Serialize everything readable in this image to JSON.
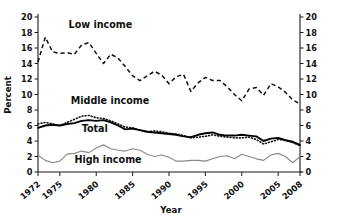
{
  "chart_data": {
    "type": "line",
    "title": "",
    "xlabel": "Year",
    "ylabel": "Percent",
    "xlim": [
      1972,
      2008
    ],
    "ylim": [
      0,
      20
    ],
    "grid": false,
    "legend": "inline-labels",
    "y_ticks": [
      0,
      2,
      4,
      6,
      8,
      10,
      12,
      14,
      16,
      18,
      20
    ],
    "y_ticks_right": [
      0,
      2,
      4,
      6,
      8,
      10,
      12,
      14,
      16,
      18,
      20
    ],
    "x_ticks": [
      1972,
      1975,
      1980,
      1985,
      1990,
      1995,
      2000,
      2005,
      2008
    ],
    "x": [
      1972,
      1973,
      1974,
      1975,
      1976,
      1977,
      1978,
      1979,
      1980,
      1981,
      1982,
      1983,
      1984,
      1985,
      1986,
      1987,
      1988,
      1989,
      1990,
      1991,
      1992,
      1993,
      1994,
      1995,
      1996,
      1997,
      1998,
      1999,
      2000,
      2001,
      2002,
      2003,
      2004,
      2005,
      2006,
      2007,
      2008
    ],
    "series": [
      {
        "name": "Low income",
        "style": "dashed",
        "color": "#111111",
        "label_x": 1976.2,
        "label_y": 18.6,
        "values": [
          14.2,
          17.4,
          15.5,
          15.3,
          15.4,
          15.2,
          16.4,
          16.7,
          15.3,
          14.0,
          15.2,
          14.7,
          13.6,
          12.4,
          11.8,
          12.4,
          13.0,
          12.5,
          11.4,
          12.3,
          12.6,
          10.4,
          11.5,
          12.2,
          11.8,
          11.8,
          11.0,
          10.0,
          9.2,
          10.7,
          10.9,
          9.9,
          11.4,
          11.0,
          10.3,
          9.3,
          8.8
        ]
      },
      {
        "name": "Middle income",
        "style": "dotted",
        "color": "#111111",
        "label_x": 1976.5,
        "label_y": 8.8,
        "values": [
          6.2,
          6.4,
          6.2,
          6.0,
          6.4,
          6.8,
          7.2,
          7.3,
          7.0,
          6.9,
          6.6,
          6.2,
          5.8,
          5.7,
          5.4,
          5.2,
          5.3,
          5.2,
          5.0,
          4.9,
          4.7,
          4.4,
          4.5,
          4.6,
          4.8,
          4.6,
          4.5,
          4.4,
          4.4,
          4.5,
          4.2,
          3.6,
          3.9,
          4.2,
          4.1,
          3.8,
          3.4
        ]
      },
      {
        "name": "Total",
        "style": "solid",
        "color": "#000000",
        "label_x": 1978.0,
        "label_y": 5.1,
        "values": [
          5.7,
          6.0,
          6.1,
          6.0,
          6.2,
          6.3,
          6.6,
          6.7,
          6.6,
          6.7,
          6.4,
          6.0,
          5.5,
          5.6,
          5.4,
          5.2,
          5.1,
          5.0,
          4.9,
          4.8,
          4.6,
          4.5,
          4.8,
          5.0,
          5.1,
          4.8,
          4.7,
          4.7,
          4.8,
          4.7,
          4.6,
          4.0,
          4.3,
          4.4,
          4.1,
          3.9,
          3.5
        ]
      },
      {
        "name": "High income",
        "style": "solid-thin",
        "color": "#8a8a8a",
        "label_x": 1977.0,
        "label_y": 1.2,
        "values": [
          2.2,
          1.5,
          1.2,
          1.4,
          2.3,
          2.4,
          2.7,
          2.5,
          3.1,
          3.5,
          3.0,
          2.8,
          2.7,
          3.0,
          2.8,
          2.3,
          2.0,
          2.2,
          1.9,
          1.4,
          1.4,
          1.5,
          1.5,
          1.4,
          1.7,
          2.0,
          2.1,
          1.7,
          2.3,
          2.0,
          1.7,
          1.5,
          2.2,
          2.4,
          2.0,
          1.2,
          2.0
        ]
      }
    ]
  }
}
